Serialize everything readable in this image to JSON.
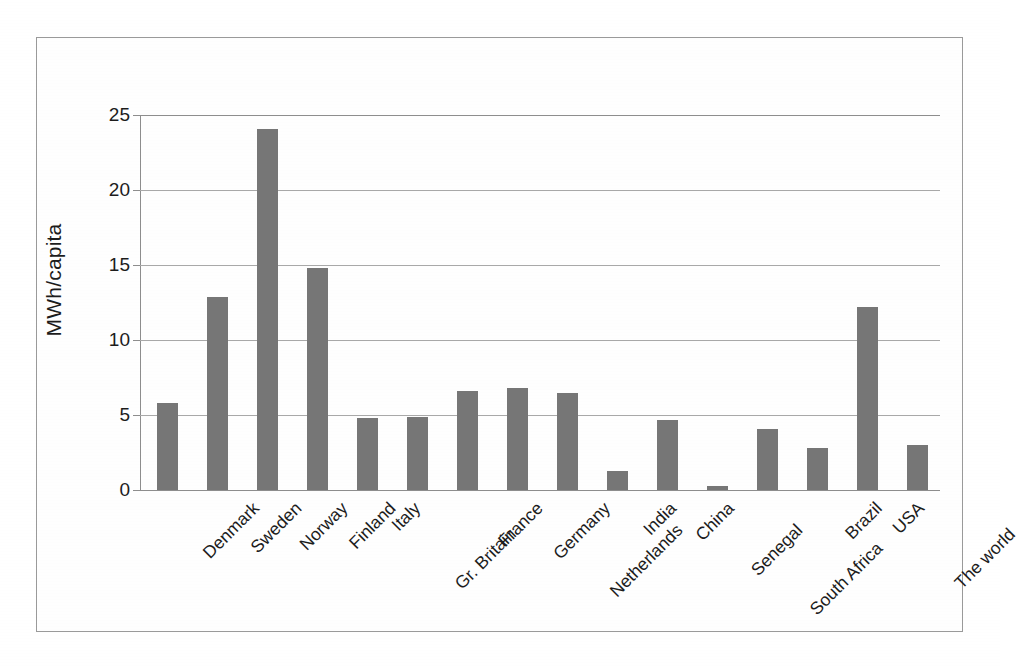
{
  "chart_data": {
    "type": "bar",
    "title": "",
    "xlabel": "",
    "ylabel": "MWh/capita",
    "ylim": [
      0,
      25
    ],
    "yticks": [
      0,
      5,
      10,
      15,
      20,
      25
    ],
    "ytick_labels": [
      "0",
      "5",
      "10",
      "15",
      "20",
      "25"
    ],
    "grid": true,
    "legend": "none",
    "bar_color": "#767676",
    "categories": [
      "Denmark",
      "Sweden",
      "Norway",
      "Finland",
      "Italy",
      "Gr. Britain",
      "France",
      "Germany",
      "Netherlands",
      "India",
      "China",
      "Senegal",
      "South Africa",
      "Brazil",
      "USA",
      "The world"
    ],
    "values": [
      5.8,
      12.9,
      24.1,
      14.8,
      4.8,
      4.9,
      6.6,
      6.8,
      6.5,
      1.3,
      4.65,
      0.3,
      4.1,
      2.8,
      12.2,
      3.0
    ]
  }
}
